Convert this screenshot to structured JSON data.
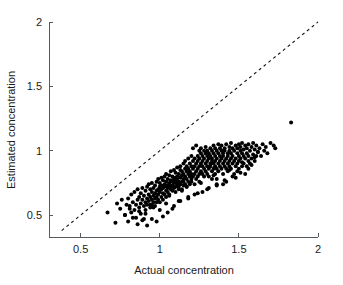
{
  "chart_data": {
    "type": "scatter",
    "title": "",
    "xlabel": "Actual concentration",
    "ylabel": "Estimated concentration",
    "xlim": [
      0.3,
      2.0
    ],
    "ylim": [
      0.33,
      2.0
    ],
    "xticks": [
      0.5,
      1,
      1.5,
      2
    ],
    "ytick_labels": [
      "0.5",
      "1",
      "1.5",
      "2"
    ],
    "xtick_labels": [
      "0.5",
      "1",
      "1.5",
      "2"
    ],
    "yticks": [
      0.5,
      1,
      1.5,
      2
    ],
    "grid": false,
    "legend": null,
    "marker": "filled-circle",
    "marker_color": "#000000",
    "marker_size_px": 3.0,
    "annotations": [
      {
        "type": "reference-line",
        "label": "identity line y = x",
        "style": "dashed",
        "color": "#111111",
        "from": [
          0.38,
          0.38
        ],
        "to": [
          2.0,
          2.0
        ]
      }
    ],
    "series": [
      {
        "name": "samples",
        "n": 352,
        "x": [
          0.67,
          0.72,
          0.73,
          0.75,
          0.76,
          0.78,
          0.79,
          0.8,
          0.8,
          0.81,
          0.82,
          0.82,
          0.83,
          0.84,
          0.84,
          0.85,
          0.85,
          0.86,
          0.86,
          0.87,
          0.87,
          0.88,
          0.88,
          0.88,
          0.89,
          0.89,
          0.9,
          0.9,
          0.9,
          0.91,
          0.91,
          0.91,
          0.92,
          0.92,
          0.92,
          0.93,
          0.93,
          0.93,
          0.94,
          0.94,
          0.94,
          0.95,
          0.95,
          0.95,
          0.95,
          0.96,
          0.96,
          0.96,
          0.97,
          0.97,
          0.97,
          0.97,
          0.98,
          0.98,
          0.98,
          0.99,
          0.99,
          0.99,
          0.99,
          1.0,
          1.0,
          1.0,
          1.0,
          1.01,
          1.01,
          1.01,
          1.01,
          1.02,
          1.02,
          1.02,
          1.02,
          1.03,
          1.03,
          1.03,
          1.03,
          1.04,
          1.04,
          1.04,
          1.04,
          1.05,
          1.05,
          1.05,
          1.05,
          1.06,
          1.06,
          1.06,
          1.06,
          1.07,
          1.07,
          1.07,
          1.07,
          1.08,
          1.08,
          1.08,
          1.08,
          1.09,
          1.09,
          1.09,
          1.09,
          1.1,
          1.1,
          1.1,
          1.1,
          1.1,
          1.11,
          1.11,
          1.11,
          1.11,
          1.12,
          1.12,
          1.12,
          1.12,
          1.13,
          1.13,
          1.13,
          1.13,
          1.14,
          1.14,
          1.14,
          1.14,
          1.15,
          1.15,
          1.15,
          1.15,
          1.15,
          1.16,
          1.16,
          1.16,
          1.16,
          1.17,
          1.17,
          1.17,
          1.17,
          1.18,
          1.18,
          1.18,
          1.18,
          1.19,
          1.19,
          1.19,
          1.19,
          1.2,
          1.2,
          1.2,
          1.2,
          1.2,
          1.21,
          1.21,
          1.21,
          1.21,
          1.22,
          1.22,
          1.22,
          1.22,
          1.23,
          1.23,
          1.23,
          1.23,
          1.24,
          1.24,
          1.24,
          1.24,
          1.25,
          1.25,
          1.25,
          1.25,
          1.25,
          1.26,
          1.26,
          1.26,
          1.26,
          1.27,
          1.27,
          1.27,
          1.27,
          1.28,
          1.28,
          1.28,
          1.28,
          1.29,
          1.29,
          1.29,
          1.29,
          1.3,
          1.3,
          1.3,
          1.3,
          1.3,
          1.31,
          1.31,
          1.31,
          1.31,
          1.32,
          1.32,
          1.32,
          1.32,
          1.33,
          1.33,
          1.33,
          1.33,
          1.34,
          1.34,
          1.34,
          1.34,
          1.35,
          1.35,
          1.35,
          1.35,
          1.35,
          1.36,
          1.36,
          1.36,
          1.36,
          1.37,
          1.37,
          1.37,
          1.37,
          1.38,
          1.38,
          1.38,
          1.38,
          1.39,
          1.39,
          1.39,
          1.39,
          1.4,
          1.4,
          1.4,
          1.4,
          1.4,
          1.41,
          1.41,
          1.41,
          1.41,
          1.42,
          1.42,
          1.42,
          1.43,
          1.43,
          1.43,
          1.43,
          1.44,
          1.44,
          1.44,
          1.44,
          1.45,
          1.45,
          1.45,
          1.45,
          1.46,
          1.46,
          1.46,
          1.47,
          1.47,
          1.47,
          1.48,
          1.48,
          1.48,
          1.49,
          1.49,
          1.49,
          1.5,
          1.5,
          1.5,
          1.5,
          1.51,
          1.51,
          1.51,
          1.52,
          1.52,
          1.52,
          1.53,
          1.53,
          1.53,
          1.54,
          1.54,
          1.55,
          1.55,
          1.55,
          1.56,
          1.56,
          1.56,
          1.57,
          1.57,
          1.58,
          1.58,
          1.59,
          1.59,
          1.6,
          1.6,
          1.61,
          1.61,
          1.62,
          1.63,
          1.64,
          1.65,
          1.66,
          1.67,
          1.68,
          1.7,
          1.72,
          1.73,
          0.86,
          0.89,
          0.92,
          0.95,
          0.98,
          1.02,
          1.05,
          1.08,
          0.78,
          0.83,
          0.87,
          0.91,
          0.96,
          1.0,
          1.04,
          1.09,
          1.13,
          1.18,
          1.22,
          1.27,
          1.31,
          1.36,
          1.41,
          1.46,
          1.51,
          1.56,
          1.58,
          1.83,
          1.12,
          1.18,
          1.24,
          1.3,
          1.36,
          1.42,
          1.48,
          1.54,
          0.94,
          1.06,
          1.14,
          1.26,
          1.34,
          1.44,
          1.52,
          1.6,
          0.81,
          0.98,
          1.17,
          1.33,
          1.49,
          1.62
        ],
        "y": [
          0.52,
          0.44,
          0.59,
          0.55,
          0.62,
          0.5,
          0.58,
          0.45,
          0.63,
          0.57,
          0.52,
          0.66,
          0.6,
          0.54,
          0.68,
          0.58,
          0.48,
          0.62,
          0.7,
          0.56,
          0.64,
          0.59,
          0.67,
          0.51,
          0.62,
          0.71,
          0.57,
          0.65,
          0.47,
          0.6,
          0.69,
          0.54,
          0.63,
          0.72,
          0.58,
          0.66,
          0.61,
          0.74,
          0.64,
          0.56,
          0.7,
          0.62,
          0.68,
          0.58,
          0.75,
          0.65,
          0.71,
          0.6,
          0.67,
          0.73,
          0.63,
          0.57,
          0.69,
          0.76,
          0.64,
          0.7,
          0.62,
          0.78,
          0.66,
          0.72,
          0.68,
          0.6,
          0.75,
          0.7,
          0.64,
          0.79,
          0.73,
          0.67,
          0.71,
          0.62,
          0.77,
          0.72,
          0.66,
          0.8,
          0.74,
          0.69,
          0.76,
          0.64,
          0.82,
          0.73,
          0.68,
          0.78,
          0.71,
          0.75,
          0.66,
          0.81,
          0.74,
          0.7,
          0.77,
          0.72,
          0.84,
          0.76,
          0.69,
          0.8,
          0.73,
          0.78,
          0.71,
          0.85,
          0.75,
          0.79,
          0.72,
          0.83,
          0.76,
          0.68,
          0.8,
          0.74,
          0.87,
          0.78,
          0.72,
          0.82,
          0.76,
          0.7,
          0.85,
          0.79,
          0.74,
          0.88,
          0.81,
          0.76,
          0.7,
          0.84,
          0.78,
          0.73,
          0.9,
          0.82,
          0.76,
          0.86,
          0.8,
          0.74,
          0.92,
          0.84,
          0.78,
          0.72,
          0.88,
          0.82,
          0.76,
          0.94,
          0.86,
          0.8,
          0.74,
          0.9,
          0.84,
          0.78,
          0.96,
          0.88,
          0.82,
          0.76,
          1.02,
          0.92,
          0.86,
          0.8,
          0.74,
          0.94,
          0.88,
          0.82,
          1.04,
          0.9,
          0.84,
          0.78,
          0.96,
          0.92,
          0.86,
          0.8,
          1.0,
          0.94,
          0.88,
          0.82,
          0.76,
          0.98,
          0.9,
          0.84,
          1.02,
          0.96,
          0.88,
          0.82,
          0.92,
          1.0,
          0.94,
          0.86,
          0.8,
          0.98,
          0.9,
          0.84,
          1.03,
          0.96,
          0.88,
          0.82,
          0.92,
          1.0,
          0.94,
          0.86,
          0.8,
          0.98,
          0.9,
          1.02,
          0.96,
          0.88,
          0.84,
          0.92,
          1.0,
          0.94,
          0.86,
          1.04,
          0.98,
          0.9,
          0.82,
          0.96,
          1.02,
          0.92,
          0.88,
          0.78,
          1.0,
          0.94,
          0.86,
          1.05,
          0.98,
          0.9,
          0.84,
          0.96,
          1.02,
          0.92,
          0.88,
          1.0,
          0.94,
          0.86,
          1.04,
          0.98,
          0.9,
          0.82,
          0.96,
          0.74,
          1.02,
          0.92,
          0.88,
          1.0,
          0.94,
          0.86,
          1.05,
          0.98,
          0.9,
          0.84,
          0.96,
          1.03,
          0.92,
          0.88,
          1.0,
          0.94,
          1.06,
          0.86,
          0.98,
          0.9,
          1.02,
          0.96,
          0.82,
          0.92,
          1.0,
          1.04,
          0.88,
          0.94,
          0.98,
          0.9,
          1.02,
          0.96,
          1.05,
          0.86,
          0.92,
          1.0,
          0.94,
          1.03,
          0.88,
          0.98,
          1.06,
          0.9,
          0.96,
          1.01,
          0.94,
          1.04,
          0.88,
          0.98,
          1.02,
          0.92,
          0.96,
          1.05,
          0.9,
          1.0,
          0.94,
          1.03,
          0.97,
          1.06,
          0.92,
          1.01,
          0.96,
          1.04,
          0.99,
          1.02,
          0.96,
          1.05,
          1.0,
          1.03,
          0.98,
          1.06,
          1.04,
          1.02,
          0.43,
          0.46,
          0.42,
          0.47,
          0.45,
          0.49,
          0.52,
          0.55,
          0.5,
          0.48,
          0.53,
          0.51,
          0.56,
          0.54,
          0.59,
          0.57,
          0.61,
          0.63,
          0.66,
          0.68,
          0.71,
          0.74,
          0.77,
          0.8,
          0.83,
          0.86,
          0.89,
          1.22,
          0.61,
          0.64,
          0.67,
          0.7,
          0.73,
          0.76,
          0.79,
          0.82,
          0.58,
          0.65,
          0.69,
          0.75,
          0.81,
          0.85,
          0.91,
          0.95,
          0.55,
          0.6,
          0.72,
          0.78,
          0.84,
          0.99
        ]
      }
    ]
  },
  "axes": {
    "x_axis_name": "actual-concentration-axis",
    "y_axis_name": "estimated-concentration-axis"
  }
}
